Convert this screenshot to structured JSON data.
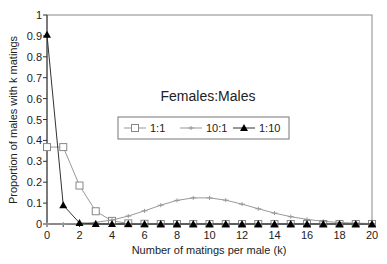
{
  "chart_data": {
    "type": "line",
    "title": "Females:Males",
    "xlabel": "Number of matings per male (k)",
    "ylabel": "Proportion of males with k matings",
    "xlim": [
      0,
      20
    ],
    "ylim": [
      0,
      1
    ],
    "x_ticks": [
      "0",
      "2",
      "4",
      "6",
      "8",
      "10",
      "12",
      "14",
      "16",
      "18",
      "20"
    ],
    "y_ticks": [
      "0",
      "0.1",
      "0.2",
      "0.3",
      "0.4",
      "0.5",
      "0.6",
      "0.7",
      "0.8",
      "0.9",
      "1"
    ],
    "grid": false,
    "legend_position": "center",
    "x": [
      0,
      1,
      2,
      3,
      4,
      5,
      6,
      7,
      8,
      9,
      10,
      11,
      12,
      13,
      14,
      15,
      16,
      17,
      18,
      19,
      20
    ],
    "series": [
      {
        "name": "1:1",
        "marker": "open-square",
        "values": [
          0.368,
          0.368,
          0.184,
          0.061,
          0.015,
          0.003,
          0.001,
          0,
          0,
          0,
          0,
          0,
          0,
          0,
          0,
          0,
          0,
          0,
          0,
          0,
          0
        ]
      },
      {
        "name": "10:1",
        "marker": "star",
        "values": [
          0,
          0,
          0.002,
          0.008,
          0.019,
          0.038,
          0.063,
          0.09,
          0.113,
          0.125,
          0.125,
          0.114,
          0.095,
          0.073,
          0.052,
          0.035,
          0.022,
          0.013,
          0.007,
          0.004,
          0.002
        ]
      },
      {
        "name": "1:10",
        "marker": "filled-triangle",
        "values": [
          0.905,
          0.09,
          0.005,
          0,
          0,
          0,
          0,
          0,
          0,
          0,
          0,
          0,
          0,
          0,
          0,
          0,
          0,
          0,
          0,
          0,
          0
        ]
      }
    ]
  }
}
